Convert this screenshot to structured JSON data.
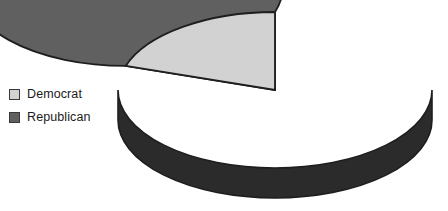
{
  "chart_data": {
    "type": "pie",
    "title": "",
    "categories": [
      "Democrat",
      "Republican"
    ],
    "values": [
      20,
      80
    ],
    "labels": [
      "Democrat",
      "Republican"
    ],
    "slice_colors": [
      "#d2d2d2",
      "#606060"
    ],
    "legend_position": "left",
    "three_d": true,
    "start_angle_deg": 90,
    "direction": "counterclockwise",
    "data_labels_shown": false,
    "grid": false,
    "xlabel": "",
    "ylabel": ""
  },
  "legend": {
    "items": [
      {
        "label": "Democrat",
        "color": "#d2d2d2"
      },
      {
        "label": "Republican",
        "color": "#606060"
      }
    ]
  },
  "colors": {
    "background": "#ffffff",
    "democrat_top": "#d2d2d2",
    "democrat_side": "#8f8f8f",
    "republican_top": "#606060",
    "republican_side": "#2b2b2b",
    "outline": "#1e1e1e",
    "legend_text": "#1a1a1a"
  },
  "geometry": {
    "center_x": 275,
    "center_y": 90,
    "radius_x": 157,
    "radius_y": 78,
    "depth": 30
  }
}
